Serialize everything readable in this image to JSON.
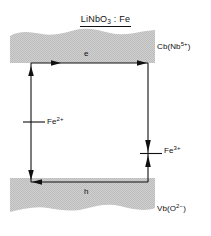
{
  "figure": {
    "title": {
      "formula_main": "LiNbO",
      "formula_sub": "3",
      "formula_tail": " : Fe",
      "plain": "LiNbO3 : Fe"
    },
    "bands": [
      {
        "id": "conduction-band",
        "label_prefix": "Cb(Nb",
        "label_sup": "5+",
        "label_suffix": ")",
        "plain": "Cb(Nb5+)",
        "fill_color": "#c9c9c9"
      },
      {
        "id": "valence-band",
        "label_prefix": "Vb(O",
        "label_sup": "2−",
        "label_suffix": ")",
        "plain": "Vb(O2-)",
        "fill_color": "#c9c9c9"
      }
    ],
    "carriers": [
      {
        "id": "electron-path",
        "label": "e"
      },
      {
        "id": "hole-path",
        "label": "h"
      }
    ],
    "levels": [
      {
        "id": "fe2-level",
        "label_prefix": "Fe",
        "label_sup": "2+",
        "plain": "Fe2+"
      },
      {
        "id": "fe3-level",
        "label_prefix": "Fe",
        "label_sup": "3+",
        "plain": "Fe3+"
      }
    ],
    "colors": {
      "line": "#101010",
      "band_fill": "#c9c9c9",
      "background": "#ffffff"
    }
  }
}
